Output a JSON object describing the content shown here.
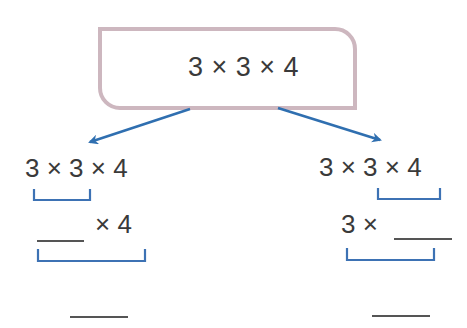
{
  "top_box": {
    "expression": "3 × 3 × 4",
    "border_color": "#cdb7bf"
  },
  "arrow_color": "#2f6fb0",
  "bracket_color": "#3d72b4",
  "left_branch": {
    "row1": "3 × 3 × 4",
    "row2_suffix": "× 4",
    "grouped": "3 × 3"
  },
  "right_branch": {
    "row1": "3 × 3 × 4",
    "row2_prefix": "3 ×",
    "grouped": "3 × 4"
  }
}
